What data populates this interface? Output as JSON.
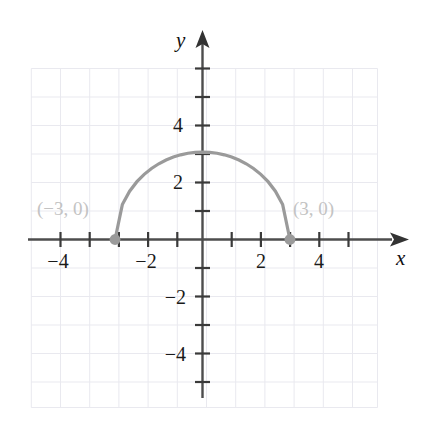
{
  "figure": {
    "title": "",
    "axis_labels": {
      "x": "x",
      "y": "y"
    },
    "point_labels": {
      "left": "(−3, 0)",
      "right": "(3, 0)"
    },
    "colors": {
      "grid": "#e9e9ef",
      "axis": "#4d4d4d",
      "curve": "#9a9a9a",
      "point": "#9a9a9a",
      "point_label": "#c3c3c3",
      "tick_text": "#1a1a1a",
      "background": "#ffffff"
    }
  },
  "chart_data": {
    "type": "line",
    "title": "",
    "xlabel": "x",
    "ylabel": "y",
    "xlim": [
      -6,
      6
    ],
    "ylim": [
      -6,
      6
    ],
    "grid": true,
    "legend": null,
    "x_ticks": [
      -4,
      -2,
      2,
      4
    ],
    "y_ticks": [
      -4,
      -2,
      2,
      4
    ],
    "x_tick_labels": [
      "−4",
      "−2",
      "2",
      "4"
    ],
    "y_tick_labels": [
      "−4",
      "−2",
      "2",
      "4"
    ],
    "minor_tick_values": [
      -5,
      -3,
      -1,
      1,
      3,
      5
    ],
    "series": [
      {
        "name": "upper semicircle",
        "equation": "y = sqrt(9 - x^2)",
        "domain": [
          -3,
          3
        ],
        "range": [
          0,
          3
        ],
        "x": [
          -3,
          -2.75,
          -2.5,
          -2.25,
          -2,
          -1.75,
          -1.5,
          -1.25,
          -1,
          -0.75,
          -0.5,
          -0.25,
          0,
          0.25,
          0.5,
          0.75,
          1,
          1.25,
          1.5,
          1.75,
          2,
          2.25,
          2.5,
          2.75,
          3
        ],
        "values": [
          0,
          1.198,
          1.658,
          1.984,
          2.236,
          2.437,
          2.598,
          2.727,
          2.828,
          2.905,
          2.958,
          2.99,
          3,
          2.99,
          2.958,
          2.905,
          2.828,
          2.727,
          2.598,
          2.437,
          2.236,
          1.984,
          1.658,
          1.198,
          0
        ]
      }
    ],
    "annotated_points": [
      {
        "label": "(−3, 0)",
        "x": -3,
        "y": 0
      },
      {
        "label": "(3, 0)",
        "x": 3,
        "y": 0
      }
    ]
  }
}
